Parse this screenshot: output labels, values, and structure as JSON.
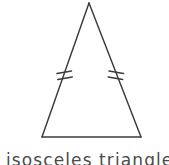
{
  "figure": {
    "kind": "geometry-diagram",
    "shape_name": "isosceles triangle",
    "background_color": "#ffffff",
    "stroke_color": "#3b3b3b",
    "stroke_width": 1.4
  },
  "triangle": {
    "label": "isosceles-triangle",
    "vertices": {
      "apex": {
        "x": 89,
        "y": 3
      },
      "base_left": {
        "x": 42,
        "y": 137
      },
      "base_right": {
        "x": 141,
        "y": 137
      }
    },
    "sides": [
      {
        "name": "left-leg",
        "from": "apex",
        "to": "base_left",
        "tick_count": 2
      },
      {
        "name": "right-leg",
        "from": "apex",
        "to": "base_right",
        "tick_count": 2
      },
      {
        "name": "base",
        "from": "base_left",
        "to": "base_right",
        "tick_count": 0
      }
    ]
  },
  "tick_marks": {
    "description": "double hash congruence marks indicating the two legs are equal",
    "left": {
      "center_x": 64,
      "center_y": 76,
      "count": 2
    },
    "right": {
      "center_x": 116,
      "center_y": 76,
      "count": 2
    }
  },
  "caption": {
    "text": "isosceles triangle",
    "clipped": "true",
    "color": "#4a4a4a"
  }
}
